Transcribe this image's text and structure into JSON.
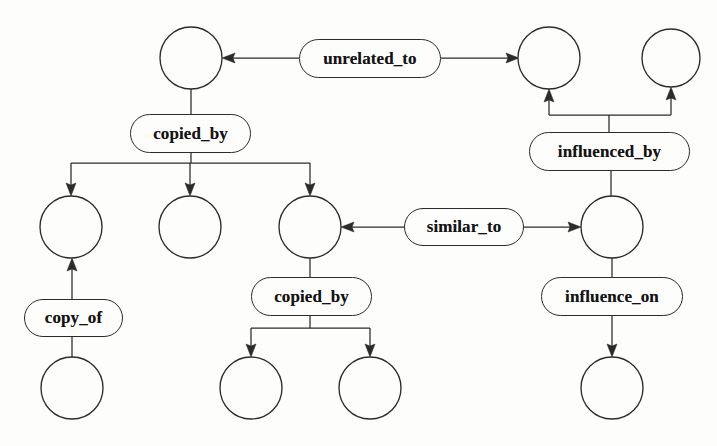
{
  "diagram": {
    "background_color": "#fdfdfc",
    "stroke_color": "#2b2b2b",
    "nodes": [
      {
        "id": "n1",
        "name": "node-top-left",
        "cx": 191,
        "cy": 58,
        "r": 31
      },
      {
        "id": "n2",
        "name": "node-top-right-a",
        "cx": 549,
        "cy": 58,
        "r": 31
      },
      {
        "id": "n3",
        "name": "node-top-right-b",
        "cx": 671,
        "cy": 58,
        "r": 29
      },
      {
        "id": "n4",
        "name": "node-mid-left",
        "cx": 71,
        "cy": 227,
        "r": 31
      },
      {
        "id": "n5",
        "name": "node-mid-center-left",
        "cx": 190,
        "cy": 227,
        "r": 31
      },
      {
        "id": "n6",
        "name": "node-mid-center",
        "cx": 310,
        "cy": 227,
        "r": 31
      },
      {
        "id": "n7",
        "name": "node-mid-right",
        "cx": 612,
        "cy": 227,
        "r": 31
      },
      {
        "id": "n8",
        "name": "node-bottom-left",
        "cx": 72,
        "cy": 388,
        "r": 31
      },
      {
        "id": "n9",
        "name": "node-bottom-center-left",
        "cx": 251,
        "cy": 388,
        "r": 31
      },
      {
        "id": "n10",
        "name": "node-bottom-center-right",
        "cx": 370,
        "cy": 388,
        "r": 31
      },
      {
        "id": "n11",
        "name": "node-bottom-right",
        "cx": 612,
        "cy": 388,
        "r": 31
      }
    ],
    "labels": [
      {
        "id": "l1",
        "name": "edge-label-unrelated-to",
        "text": "unrelated_to",
        "x": 299,
        "y": 39,
        "w": 142,
        "h": 39,
        "font_size": 17
      },
      {
        "id": "l2",
        "name": "edge-label-copied-by-top",
        "text": "copied_by",
        "x": 130,
        "y": 114,
        "w": 121,
        "h": 39,
        "font_size": 17
      },
      {
        "id": "l3",
        "name": "edge-label-influenced-by",
        "text": "influenced_by",
        "x": 529,
        "y": 132,
        "w": 161,
        "h": 39,
        "font_size": 17
      },
      {
        "id": "l4",
        "name": "edge-label-similar-to",
        "text": "similar_to",
        "x": 404,
        "y": 208,
        "w": 120,
        "h": 38,
        "font_size": 17
      },
      {
        "id": "l5",
        "name": "edge-label-copy-of",
        "text": "copy_of",
        "x": 24,
        "y": 299,
        "w": 99,
        "h": 38,
        "font_size": 17
      },
      {
        "id": "l6",
        "name": "edge-label-copied-by-mid",
        "text": "copied_by",
        "x": 251,
        "y": 277,
        "w": 121,
        "h": 39,
        "font_size": 17
      },
      {
        "id": "l7",
        "name": "edge-label-influence-on",
        "text": "influence_on",
        "x": 541,
        "y": 277,
        "w": 142,
        "h": 39,
        "font_size": 17
      }
    ],
    "relations": [
      {
        "label": "unrelated_to",
        "from": "node-top-left",
        "to": "node-top-right-a",
        "kind": "bidirectional"
      },
      {
        "label": "copied_by",
        "from": "node-top-left",
        "to": "node-mid-left",
        "kind": "directed"
      },
      {
        "label": "copied_by",
        "from": "node-top-left",
        "to": "node-mid-center-left",
        "kind": "directed"
      },
      {
        "label": "copied_by",
        "from": "node-top-left",
        "to": "node-mid-center",
        "kind": "directed"
      },
      {
        "label": "influenced_by",
        "from": "node-mid-right",
        "to": "node-top-right-a",
        "kind": "directed"
      },
      {
        "label": "influenced_by",
        "from": "node-mid-right",
        "to": "node-top-right-b",
        "kind": "directed"
      },
      {
        "label": "similar_to",
        "from": "node-mid-center",
        "to": "node-mid-right",
        "kind": "bidirectional"
      },
      {
        "label": "copy_of",
        "from": "node-bottom-left",
        "to": "node-mid-left",
        "kind": "directed"
      },
      {
        "label": "copied_by",
        "from": "node-mid-center",
        "to": "node-bottom-center-left",
        "kind": "directed"
      },
      {
        "label": "copied_by",
        "from": "node-mid-center",
        "to": "node-bottom-center-right",
        "kind": "directed"
      },
      {
        "label": "influence_on",
        "from": "node-mid-right",
        "to": "node-bottom-right",
        "kind": "directed"
      }
    ]
  }
}
